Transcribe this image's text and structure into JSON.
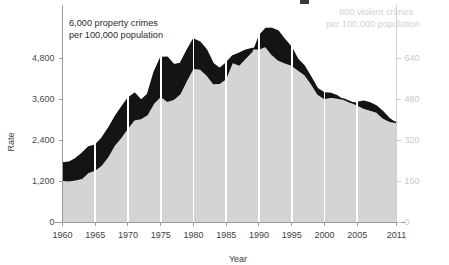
{
  "chart_data": {
    "type": "area",
    "title": "",
    "xlabel": "Year",
    "ylabel": "Rate",
    "grid": "vertical-white-5yr",
    "legend": "inline-annotations",
    "x": [
      1960,
      1961,
      1962,
      1963,
      1964,
      1965,
      1966,
      1967,
      1968,
      1969,
      1970,
      1971,
      1972,
      1973,
      1974,
      1975,
      1976,
      1977,
      1978,
      1979,
      1980,
      1981,
      1982,
      1983,
      1984,
      1985,
      1986,
      1987,
      1988,
      1989,
      1990,
      1991,
      1992,
      1993,
      1994,
      1995,
      1996,
      1997,
      1998,
      1999,
      2000,
      2001,
      2002,
      2003,
      2004,
      2005,
      2006,
      2007,
      2008,
      2009,
      2010,
      2011
    ],
    "xlim": [
      1960,
      2011
    ],
    "x_ticks": [
      "1960",
      "1965",
      "1970",
      "1975",
      "1980",
      "1985",
      "1990",
      "1995",
      "2000",
      "2005",
      "2011"
    ],
    "x_tick_values": [
      1960,
      1965,
      1970,
      1975,
      1980,
      1985,
      1990,
      1995,
      2000,
      2005,
      2011
    ],
    "left_axis": {
      "label": "Rate",
      "ticks": [
        "0",
        "1,200",
        "2,400",
        "3,600",
        "4,800"
      ],
      "tick_values": [
        0,
        1200,
        2400,
        3600,
        4800
      ],
      "ylim": [
        0,
        6000
      ],
      "color": "#4a4a4a"
    },
    "right_axis": {
      "label": "",
      "ticks": [
        "0",
        "160",
        "320",
        "480",
        "640"
      ],
      "tick_values": [
        0,
        160,
        320,
        480,
        640
      ],
      "ylim": [
        0,
        800
      ],
      "color": "#c9c9c9"
    },
    "series": [
      {
        "name": "property crimes per 100,000 population",
        "axis": "left",
        "render": "line",
        "color": "#141414",
        "values": [
          1726,
          1747,
          1857,
          2012,
          2198,
          2249,
          2451,
          2736,
          3072,
          3351,
          3621,
          3769,
          3561,
          3737,
          4389,
          4811,
          4820,
          4602,
          4643,
          5017,
          5353,
          5264,
          5033,
          4637,
          4492,
          4651,
          4863,
          4940,
          5027,
          5078,
          5073,
          5140,
          4903,
          4738,
          4660,
          4591,
          4451,
          4316,
          4053,
          3744,
          3618,
          3658,
          3631,
          3591,
          3514,
          3431,
          3335,
          3276,
          3215,
          3041,
          2946,
          2909
        ]
      },
      {
        "name": "violent crimes per 100,000 population",
        "axis": "right",
        "render": "area",
        "color": "#d4d4d4",
        "values": [
          160,
          158,
          162,
          168,
          191,
          200,
          220,
          253,
          298,
          328,
          364,
          396,
          401,
          417,
          461,
          488,
          468,
          476,
          498,
          549,
          597,
          594,
          571,
          538,
          539,
          557,
          620,
          610,
          637,
          663,
          730,
          758,
          758,
          747,
          714,
          685,
          637,
          611,
          568,
          523,
          506,
          504,
          495,
          476,
          463,
          469,
          474,
          467,
          455,
          432,
          405,
          387
        ]
      }
    ],
    "annotations": [
      {
        "id": "left-annotation",
        "line1": "6,000 property crimes",
        "line2": "per 100,000 population",
        "color": "#2b2b2b"
      },
      {
        "id": "right-annotation",
        "line1": "800 violent crimes",
        "line2": "per 100,000 population",
        "color": "#d2d2d2"
      }
    ]
  },
  "axes": {
    "y_label": "Rate",
    "x_label": "Year"
  },
  "left_ticks": [
    {
      "label": "4,800"
    },
    {
      "label": "3,600"
    },
    {
      "label": "2,400"
    },
    {
      "label": "1,200"
    },
    {
      "label": "0"
    }
  ],
  "right_ticks": [
    {
      "label": "640"
    },
    {
      "label": "480"
    },
    {
      "label": "320"
    },
    {
      "label": "160"
    },
    {
      "label": "0"
    }
  ],
  "x_ticks": [
    {
      "label": "1960"
    },
    {
      "label": "1965"
    },
    {
      "label": "1970"
    },
    {
      "label": "1975"
    },
    {
      "label": "1980"
    },
    {
      "label": "1985"
    },
    {
      "label": "1990"
    },
    {
      "label": "1995"
    },
    {
      "label": "2000"
    },
    {
      "label": "2005"
    },
    {
      "label": "2011"
    }
  ],
  "annotation_left": {
    "line1": "6,000 property crimes",
    "line2": "per 100,000 population"
  },
  "annotation_right": {
    "line1": "800 violent crimes",
    "line2": "per 100,000 population"
  }
}
